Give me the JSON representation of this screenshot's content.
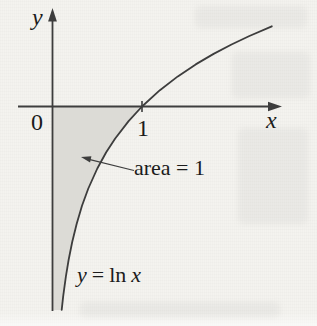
{
  "figure": {
    "axis_labels": {
      "y": "y",
      "x": "x"
    },
    "origin_label": "0",
    "x_tick_label": "1",
    "area_annotation": "area = 1",
    "equation": {
      "lhs": "y",
      "equals": "=",
      "fn": "ln",
      "arg": "x"
    }
  },
  "colors": {
    "paper": "#f4f3ef",
    "line": "#3d3d3d",
    "shade": "#dcdbd6",
    "text": "#1b1b1b"
  },
  "chart_data": {
    "type": "line",
    "title": "",
    "equation": "y = ln x",
    "xlabel": "x",
    "ylabel": "y",
    "x_range_shown": [
      0,
      2.45
    ],
    "y_range_shown": [
      -2.3,
      0.9
    ],
    "x_ticks": [
      1
    ],
    "x_intercept": 1,
    "grid": false,
    "legend": "none",
    "shaded_region": {
      "description": "region bounded by the y-axis, the x-axis and the curve y = ln x for 0 < x <= 1",
      "area": 1,
      "label": "area = 1"
    },
    "series": [
      {
        "name": "y = ln x",
        "points": [
          [
            0.103,
            -2.273
          ],
          [
            0.12,
            -2.12
          ],
          [
            0.15,
            -1.897
          ],
          [
            0.18,
            -1.715
          ],
          [
            0.22,
            -1.514
          ],
          [
            0.27,
            -1.309
          ],
          [
            0.33,
            -1.109
          ],
          [
            0.4,
            -0.916
          ],
          [
            0.5,
            -0.693
          ],
          [
            0.6,
            -0.511
          ],
          [
            0.7,
            -0.357
          ],
          [
            0.85,
            -0.163
          ],
          [
            1.0,
            0.0
          ],
          [
            1.2,
            0.182
          ],
          [
            1.4,
            0.336
          ],
          [
            1.6,
            0.47
          ],
          [
            1.8,
            0.588
          ],
          [
            2.0,
            0.693
          ],
          [
            2.2,
            0.788
          ],
          [
            2.45,
            0.896
          ]
        ]
      }
    ],
    "plot_mapping": {
      "origin_px": [
        52.5,
        106.5
      ],
      "px_per_unit": 89.5
    }
  }
}
